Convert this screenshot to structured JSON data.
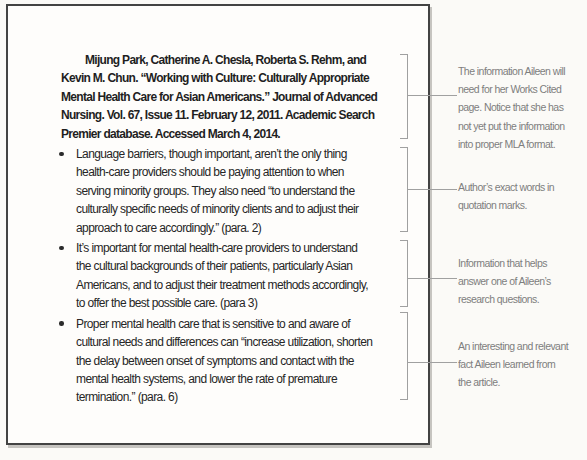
{
  "figure": {
    "note_card": {
      "citation": {
        "lines": [
          "Mijung Park, Catherine A. Chesla, Roberta S. Rehm, and",
          "Kevin M. Chun. “Working with Culture: Culturally Appropriate",
          "Mental Health Care for Asian Americans.” Journal of Advanced",
          "Nursing. Vol. 67, Issue 11. February 12, 2011. Academic Search",
          "Premier database. Accessed March 4, 2014."
        ]
      },
      "bullets": [
        {
          "lines": [
            "Language barriers, though important, aren’t the only thing",
            "health-care providers should be paying attention to when",
            "serving minority groups. They also need “to understand the",
            "culturally specific needs of minority clients and to adjust their",
            "approach to care accordingly.” (para. 2)"
          ]
        },
        {
          "lines": [
            "It’s important for mental health-care providers to understand",
            "the cultural backgrounds of their patients, particularly Asian",
            "Americans, and to adjust their treatment methods accordingly,",
            "to offer the best possible care. (para 3)"
          ]
        },
        {
          "lines": [
            "Proper mental health care that is sensitive to and aware of",
            "cultural needs and differences can “increase utilization, shorten",
            "the delay between onset of symptoms and contact with the",
            "mental health systems, and lower the rate of premature",
            "termination.” (para. 6)"
          ]
        }
      ]
    },
    "annotations": [
      {
        "id": "works-cited-note",
        "lines": [
          "The information Aileen will",
          "need for her Works Cited",
          "page. Notice that she has",
          "not yet put the information",
          "into proper MLA format."
        ]
      },
      {
        "id": "exact-words-note",
        "lines": [
          "Author’s exact words in",
          "quotation marks."
        ]
      },
      {
        "id": "research-question-note",
        "lines": [
          "Information that helps",
          "answer one of Aileen’s",
          "research questions."
        ]
      },
      {
        "id": "relevant-fact-note",
        "lines": [
          "An interesting and relevant",
          "fact Aileen learned from",
          "the article."
        ]
      }
    ],
    "colors": {
      "page_background": "#fbfaf7",
      "card_background": "#fefdfb",
      "card_border": "#434343",
      "card_text": "#262626",
      "bracket_line": "#a0a0a0",
      "annotation_text": "#7e7e7e"
    }
  }
}
